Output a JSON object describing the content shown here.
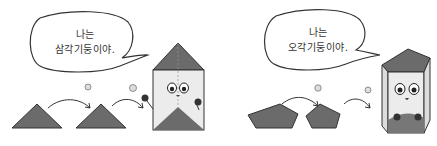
{
  "panels": [
    {
      "bubble": {
        "line1": "나는",
        "line2": "삼각기둥이야."
      },
      "base_shape": "triangle",
      "character": "triangular-prism"
    },
    {
      "bubble": {
        "line1": "나는",
        "line2": "오각기둥이야."
      },
      "base_shape": "pentagon",
      "character": "pentagonal-prism"
    }
  ],
  "colors": {
    "shape_fill": "#6b6b6b",
    "prism_face": "#ececec",
    "outline": "#333333"
  }
}
